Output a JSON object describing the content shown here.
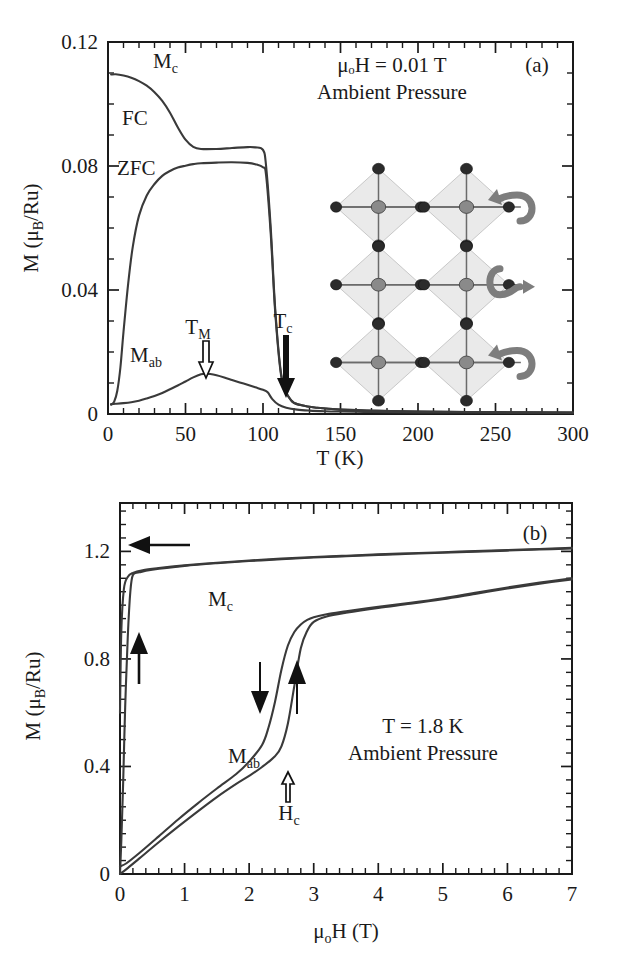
{
  "figure": {
    "panels": [
      {
        "tag": "(a)",
        "annotations": [
          "μₒH = 0.01 T",
          "Ambient Pressure"
        ],
        "xlabel": "T (K)",
        "ylabel_main": "M (",
        "ylabel_mu": "μ",
        "ylabel_sub": "B",
        "ylabel_tail": "/Ru)",
        "curve_labels": [
          {
            "name": "M_c",
            "base": "M",
            "sub": "c"
          },
          {
            "name": "FC",
            "base": "FC",
            "sub": ""
          },
          {
            "name": "ZFC",
            "base": "ZFC",
            "sub": ""
          },
          {
            "name": "M_ab",
            "base": "M",
            "sub": "ab"
          },
          {
            "name": "T_M",
            "base": "T",
            "sub": "M"
          },
          {
            "name": "T_c",
            "base": "T",
            "sub": "c"
          }
        ],
        "xticks": [
          "0",
          "50",
          "100",
          "150",
          "200",
          "250",
          "300"
        ],
        "yticks": [
          "0",
          "0.04",
          "0.08",
          "0.12"
        ]
      },
      {
        "tag": "(b)",
        "annotations": [
          "T = 1.8 K",
          "Ambient Pressure"
        ],
        "xlabel_mu": "μ",
        "xlabel_sub": "o",
        "xlabel_tail": "H (T)",
        "ylabel_main": "M (",
        "ylabel_mu": "μ",
        "ylabel_sub": "B",
        "ylabel_tail": "/Ru)",
        "curve_labels": [
          {
            "name": "M_c",
            "base": "M",
            "sub": "c"
          },
          {
            "name": "M_ab",
            "base": "M",
            "sub": "ab"
          },
          {
            "name": "H_c",
            "base": "H",
            "sub": "c"
          }
        ],
        "xticks": [
          "0",
          "1",
          "2",
          "3",
          "4",
          "5",
          "6",
          "7"
        ],
        "yticks": [
          "0",
          "0.4",
          "0.8",
          "1.2"
        ]
      }
    ],
    "colors": {
      "curve": "#3a3a3a",
      "axis": "#1a1a1a",
      "arrow": "#111111",
      "octahedron_fill": "#d9d9d9",
      "oxygen_atom": "#2b2b2b",
      "ruthenium_atom": "#8a8a8a",
      "swirl_arrow": "#7d7d7d"
    },
    "inset": {
      "name": "perovskite-octahedra-rotation-diagram",
      "rotation_arrow_count": 3
    }
  },
  "chart_data": [
    {
      "type": "line",
      "panel": "a",
      "title": "",
      "xlabel": "T (K)",
      "ylabel": "M (μB/Ru)",
      "xlim": [
        0,
        300
      ],
      "ylim": [
        0,
        0.12
      ],
      "xticks": [
        0,
        50,
        100,
        150,
        200,
        250,
        300
      ],
      "yticks": [
        0,
        0.04,
        0.08,
        0.12
      ],
      "xminor_step": 10,
      "yminor_step": 0.01,
      "grid": false,
      "legend": "inline-labels",
      "annotations": [
        {
          "text": "μₒH = 0.01 T",
          "x": 175,
          "y": 0.113
        },
        {
          "text": "Ambient Pressure",
          "x": 175,
          "y": 0.105
        },
        {
          "text": "(a)",
          "x": 288,
          "y": 0.113
        },
        {
          "text": "M_c",
          "x": 40,
          "y": 0.1105
        },
        {
          "text": "FC",
          "x": 20,
          "y": 0.0975
        },
        {
          "text": "ZFC",
          "x": 20,
          "y": 0.0805
        },
        {
          "text": "M_ab",
          "x": 33,
          "y": 0.0135
        },
        {
          "text": "T_M",
          "x": 62,
          "y": 0.0235,
          "arrow": "hollow-down",
          "points_to": [
            62,
            0.009
          ]
        },
        {
          "text": "T_c",
          "x": 114,
          "y": 0.0185,
          "arrow": "solid-down",
          "points_to": [
            114,
            0.002
          ]
        }
      ],
      "series": [
        {
          "name": "M_c FC",
          "x": [
            2,
            5,
            10,
            15,
            20,
            25,
            30,
            35,
            40,
            45,
            50,
            55,
            60,
            70,
            80,
            90,
            95,
            100,
            102,
            105,
            108,
            112,
            118,
            125,
            135,
            150,
            175,
            200,
            250,
            300
          ],
          "values": [
            0.1095,
            0.1096,
            0.1092,
            0.1085,
            0.1074,
            0.1059,
            0.1038,
            0.101,
            0.0972,
            0.0925,
            0.0885,
            0.0862,
            0.0855,
            0.0855,
            0.0858,
            0.0861,
            0.086,
            0.0852,
            0.08,
            0.06,
            0.033,
            0.012,
            0.0045,
            0.0028,
            0.002,
            0.0014,
            0.001,
            0.0008,
            0.0006,
            0.0005
          ]
        },
        {
          "name": "M_c ZFC",
          "x": [
            2,
            4,
            6,
            8,
            10,
            13,
            16,
            20,
            25,
            30,
            35,
            40,
            45,
            50,
            55,
            60,
            70,
            80,
            90,
            95,
            100,
            102,
            105,
            108,
            112,
            118,
            125,
            135,
            150,
            175,
            200,
            250,
            300
          ],
          "values": [
            0.003,
            0.004,
            0.0075,
            0.015,
            0.0265,
            0.042,
            0.054,
            0.064,
            0.0705,
            0.0742,
            0.0768,
            0.0784,
            0.0795,
            0.0801,
            0.0806,
            0.0809,
            0.0811,
            0.0812,
            0.081,
            0.0806,
            0.0796,
            0.077,
            0.058,
            0.032,
            0.0115,
            0.0045,
            0.0028,
            0.002,
            0.0014,
            0.001,
            0.0008,
            0.0006,
            0.0005
          ]
        },
        {
          "name": "M_ab",
          "x": [
            2,
            5,
            10,
            15,
            20,
            25,
            30,
            35,
            40,
            45,
            50,
            55,
            60,
            63,
            66,
            70,
            75,
            80,
            85,
            90,
            95,
            100,
            103,
            106,
            110,
            115,
            122,
            130,
            140,
            150,
            165,
            180,
            200,
            230,
            260,
            300
          ],
          "values": [
            0.0032,
            0.0033,
            0.0035,
            0.0038,
            0.0043,
            0.005,
            0.0058,
            0.0068,
            0.008,
            0.0092,
            0.0105,
            0.0118,
            0.0128,
            0.013,
            0.0129,
            0.0125,
            0.0118,
            0.011,
            0.0102,
            0.0094,
            0.0086,
            0.0078,
            0.007,
            0.0048,
            0.003,
            0.002,
            0.0014,
            0.0011,
            0.0009,
            0.0008,
            0.0007,
            0.0006,
            0.0005,
            0.0005,
            0.0004,
            0.0004
          ]
        }
      ]
    },
    {
      "type": "line",
      "panel": "b",
      "title": "",
      "xlabel": "μoH (T)",
      "ylabel": "M (μB/Ru)",
      "xlim": [
        0,
        7
      ],
      "ylim": [
        0,
        1.38
      ],
      "xticks": [
        0,
        1,
        2,
        3,
        4,
        5,
        6,
        7
      ],
      "yticks": [
        0,
        0.4,
        0.8,
        1.2
      ],
      "xminor_step": 0.2,
      "yminor_step": 0.05,
      "grid": false,
      "legend": "inline-labels",
      "annotations": [
        {
          "text": "(b)",
          "x": 6.3,
          "y": 1.32
        },
        {
          "text": "M_c",
          "x": 1.35,
          "y": 1.03
        },
        {
          "text": "M_ab",
          "x": 2.0,
          "y": 0.44
        },
        {
          "text": "H_c",
          "x": 2.55,
          "y": 0.26,
          "arrow": "hollow-up",
          "points_to": [
            2.55,
            0.37
          ]
        },
        {
          "text": "T = 1.8 K",
          "x": 4.95,
          "y": 0.62
        },
        {
          "text": "Ambient Pressure",
          "x": 4.95,
          "y": 0.52
        },
        {
          "arrow": "solid-left",
          "x": 0.65,
          "y": 1.18
        },
        {
          "arrow": "solid-up",
          "x": 0.25,
          "y": 0.7
        },
        {
          "arrow": "solid-down",
          "x": 2.22,
          "y": 0.66
        },
        {
          "arrow": "solid-up",
          "x": 2.78,
          "y": 0.68
        }
      ],
      "series": [
        {
          "name": "M_c increasing",
          "x": [
            0,
            0.02,
            0.05,
            0.08,
            0.12,
            0.16,
            0.2,
            0.3,
            0.5,
            1.0,
            1.5,
            2.0,
            2.5,
            3.0,
            3.5,
            4.0,
            4.5,
            5.0,
            5.5,
            6.0,
            6.5,
            7.0
          ],
          "values": [
            0.0,
            0.12,
            0.35,
            0.62,
            0.88,
            1.05,
            1.112,
            1.122,
            1.132,
            1.146,
            1.156,
            1.164,
            1.171,
            1.177,
            1.182,
            1.187,
            1.191,
            1.195,
            1.199,
            1.203,
            1.207,
            1.211
          ]
        },
        {
          "name": "M_c decreasing",
          "x": [
            7.0,
            6.5,
            6.0,
            5.5,
            5.0,
            4.5,
            4.0,
            3.5,
            3.0,
            2.5,
            2.0,
            1.5,
            1.0,
            0.6,
            0.35,
            0.2,
            0.12,
            0.06,
            0.02,
            0.0
          ],
          "values": [
            1.213,
            1.209,
            1.205,
            1.201,
            1.197,
            1.193,
            1.189,
            1.184,
            1.179,
            1.173,
            1.166,
            1.158,
            1.148,
            1.138,
            1.13,
            1.12,
            1.105,
            1.06,
            0.9,
            0.6
          ]
        },
        {
          "name": "M_ab increasing",
          "x": [
            0,
            0.1,
            0.3,
            0.6,
            0.9,
            1.2,
            1.5,
            1.8,
            2.0,
            2.2,
            2.4,
            2.5,
            2.6,
            2.7,
            2.8,
            2.9,
            3.0,
            3.2,
            3.5,
            4.0,
            4.5,
            5.0,
            5.5,
            6.0,
            6.5,
            7.0
          ],
          "values": [
            0.0,
            0.018,
            0.058,
            0.118,
            0.176,
            0.232,
            0.286,
            0.335,
            0.365,
            0.398,
            0.438,
            0.475,
            0.56,
            0.7,
            0.84,
            0.905,
            0.938,
            0.958,
            0.972,
            0.99,
            1.005,
            1.022,
            1.042,
            1.062,
            1.08,
            1.096
          ]
        },
        {
          "name": "M_ab decreasing",
          "x": [
            7.0,
            6.5,
            6.0,
            5.5,
            5.0,
            4.5,
            4.0,
            3.5,
            3.2,
            3.0,
            2.9,
            2.8,
            2.7,
            2.6,
            2.5,
            2.4,
            2.3,
            2.2,
            2.0,
            1.8,
            1.5,
            1.2,
            0.9,
            0.6,
            0.3,
            0.1,
            0.0
          ],
          "values": [
            1.1,
            1.084,
            1.066,
            1.046,
            1.026,
            1.009,
            0.994,
            0.977,
            0.966,
            0.955,
            0.945,
            0.928,
            0.9,
            0.85,
            0.76,
            0.64,
            0.545,
            0.48,
            0.418,
            0.372,
            0.318,
            0.262,
            0.203,
            0.14,
            0.078,
            0.04,
            0.028
          ]
        }
      ]
    }
  ]
}
